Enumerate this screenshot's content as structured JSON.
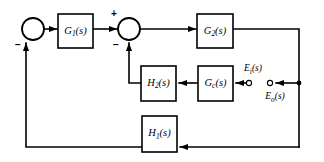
{
  "diagram": {
    "type": "control-system-block-diagram",
    "background_color": "#ffffff",
    "line_color": "#000000",
    "blocks": [
      {
        "id": "g1",
        "base": "G",
        "sub": "1",
        "suffix": "(s)",
        "label": "G1(s)",
        "x": 58,
        "y": 14,
        "w": 35,
        "h": 34
      },
      {
        "id": "g2",
        "base": "G",
        "sub": "2",
        "suffix": "(s)",
        "label": "G2(s)",
        "x": 197,
        "y": 14,
        "w": 36,
        "h": 34
      },
      {
        "id": "h2",
        "base": "H",
        "sub": "2",
        "suffix": "(s)",
        "label": "H2(s)",
        "x": 141,
        "y": 66,
        "w": 35,
        "h": 35
      },
      {
        "id": "gc",
        "base": "G",
        "sub": "c",
        "suffix": "(s)",
        "label": "Gc(s)",
        "x": 198,
        "y": 66,
        "w": 35,
        "h": 35
      },
      {
        "id": "h1",
        "base": "H",
        "sub": "1",
        "suffix": "(s)",
        "label": "H1(s)",
        "x": 142,
        "y": 116,
        "w": 35,
        "h": 36
      }
    ],
    "summing_junctions": [
      {
        "id": "sum1",
        "cx": 33,
        "cy": 29,
        "r": 11,
        "signs": [
          {
            "text": "−",
            "x": 18,
            "y": 45
          }
        ]
      },
      {
        "id": "sum2",
        "cx": 129,
        "cy": 29,
        "r": 11,
        "signs": [
          {
            "text": "+",
            "x": 114,
            "y": 14
          },
          {
            "text": "−",
            "x": 116,
            "y": 45
          }
        ]
      }
    ],
    "terminals": [
      {
        "id": "ei",
        "cx": 249,
        "cy": 83,
        "r": 2.6,
        "label_base": "E",
        "label_sub": "i",
        "label_suffix": "(s)",
        "label": "Ei(s)",
        "label_x": 253,
        "label_y": 69
      },
      {
        "id": "eo",
        "cx": 270,
        "cy": 83,
        "r": 2.6,
        "label_base": "E",
        "label_sub": "o",
        "label_suffix": "(s)",
        "label": "Eo(s)",
        "label_x": 275,
        "label_y": 97
      }
    ],
    "junction_dots": [
      {
        "id": "tap-right",
        "cx": 299,
        "cy": 83,
        "r": 2.4
      }
    ],
    "signs": {
      "minus": "−",
      "plus": "+"
    }
  }
}
